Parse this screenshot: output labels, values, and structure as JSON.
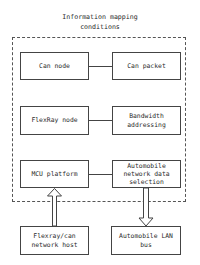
{
  "diagram": {
    "title_lines": [
      "Information mapping",
      "conditions"
    ],
    "nodes": {
      "can_node": {
        "label": [
          "Can node"
        ]
      },
      "can_packet": {
        "label": [
          "Can packet"
        ]
      },
      "flexray_node": {
        "label": [
          "FlexRay node"
        ]
      },
      "bandwidth_addressing": {
        "label": [
          "Bandwidth",
          "addressing"
        ]
      },
      "mcu_platform": {
        "label": [
          "MCU platform"
        ]
      },
      "automobile_network_data_selection": {
        "label": [
          "Automobile",
          "network data",
          "selection"
        ]
      },
      "flexray_can_network_host": {
        "label": [
          "Flexray/can",
          "network host"
        ]
      },
      "automobile_lan_bus": {
        "label": [
          "Automobile LAN",
          "bus"
        ]
      }
    },
    "edges": [
      {
        "from": "can_node",
        "to": "can_packet",
        "type": "line"
      },
      {
        "from": "flexray_node",
        "to": "bandwidth_addressing",
        "type": "line"
      },
      {
        "from": "mcu_platform",
        "to": "automobile_network_data_selection",
        "type": "line"
      },
      {
        "from": "flexray_can_network_host",
        "to": "mcu_platform",
        "type": "hollow-arrow-up"
      },
      {
        "from": "automobile_network_data_selection",
        "to": "automobile_lan_bus",
        "type": "hollow-arrow-down"
      }
    ],
    "group": {
      "label": "Information mapping conditions",
      "style": "dashed"
    },
    "colors": {
      "line": "#444444",
      "text": "#2a2a2a",
      "background": "#ffffff"
    }
  }
}
